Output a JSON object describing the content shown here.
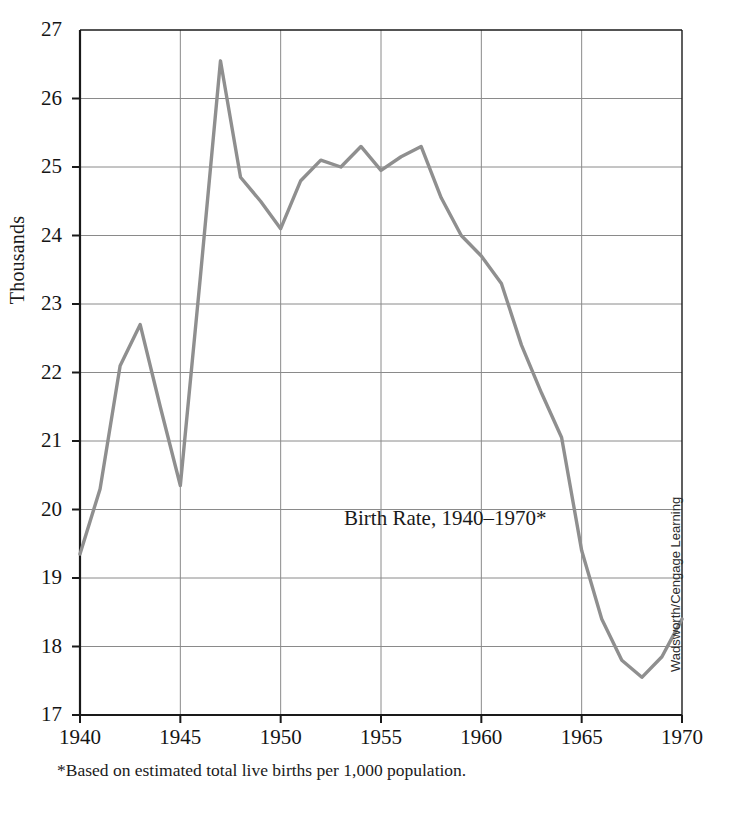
{
  "chart_data": {
    "type": "line",
    "title": "Birth Rate, 1940–1970*",
    "xlabel": "",
    "ylabel": "Thousands",
    "xlim": [
      1940,
      1970
    ],
    "ylim": [
      17,
      27
    ],
    "grid": true,
    "legend": false,
    "series_color": "#8f8f8f",
    "x": [
      1940,
      1941,
      1942,
      1943,
      1944,
      1945,
      1946,
      1947,
      1948,
      1949,
      1950,
      1951,
      1952,
      1953,
      1954,
      1955,
      1956,
      1957,
      1958,
      1959,
      1960,
      1961,
      1962,
      1963,
      1964,
      1965,
      1966,
      1967,
      1968,
      1969,
      1970
    ],
    "values": [
      19.35,
      20.3,
      22.1,
      22.7,
      21.5,
      20.35,
      23.4,
      26.55,
      24.85,
      24.5,
      24.1,
      24.8,
      25.1,
      25.0,
      25.3,
      24.95,
      25.15,
      25.3,
      24.55,
      24.0,
      23.7,
      23.3,
      22.4,
      21.7,
      21.05,
      19.4,
      18.4,
      17.8,
      17.55,
      17.85,
      18.4
    ],
    "ytick_labels": [
      "17",
      "18",
      "19",
      "20",
      "21",
      "22",
      "23",
      "24",
      "25",
      "26",
      "27"
    ],
    "ytick_values": [
      17,
      18,
      19,
      20,
      21,
      22,
      23,
      24,
      25,
      26,
      27
    ],
    "xtick_labels": [
      "1940",
      "1945",
      "1950",
      "1955",
      "1960",
      "1965",
      "1970"
    ],
    "xtick_values": [
      1940,
      1945,
      1950,
      1955,
      1960,
      1965,
      1970
    ]
  },
  "figure": {
    "y_axis_title": "Thousands",
    "annotation": "Birth Rate, 1940–1970*",
    "footnote": "*Based on estimated total live births per 1,000 population.",
    "credit": "Wadsworth/Cengage Learning"
  }
}
